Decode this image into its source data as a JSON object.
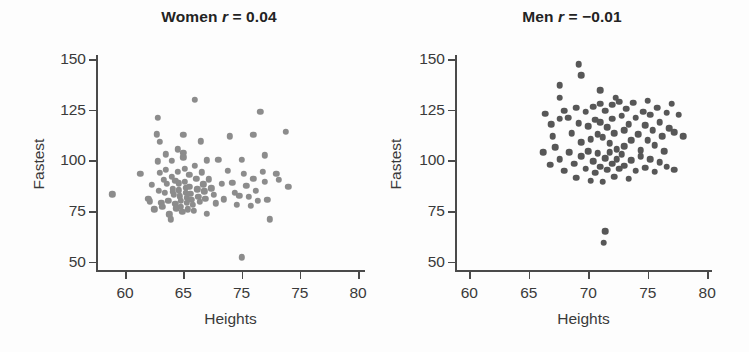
{
  "figure": {
    "background_color": "#fdfdfd",
    "axis_color": "#4a4a4a",
    "text_color": "#3a3a3a"
  },
  "chart_data": [
    {
      "type": "scatter",
      "panel_id": "women",
      "title": "Women r = 0.04",
      "title_prefix": "Women",
      "title_var": "r",
      "title_eq": " = 0.04",
      "correlation_r": 0.04,
      "xlabel": "Heights",
      "ylabel": "Fastest",
      "xlim": [
        57.5,
        80.6
      ],
      "ylim": [
        45,
        152
      ],
      "xticks": [
        60,
        65,
        70,
        75,
        80
      ],
      "xticklabels": [
        "60",
        "65",
        "75",
        "75",
        "80"
      ],
      "yticks": [
        50,
        75,
        100,
        125,
        150
      ],
      "yticklabels": [
        "50",
        "75",
        "100",
        "125",
        "150"
      ],
      "grid": false,
      "legend": "none",
      "marker_color": "#8c8c8c",
      "marker_size": 6.4,
      "n_points": 99,
      "points": [
        [
          58.9,
          83.4
        ],
        [
          61.3,
          93.3
        ],
        [
          62.0,
          81.0
        ],
        [
          62.1,
          79.8
        ],
        [
          62.3,
          88.0
        ],
        [
          62.5,
          75.9
        ],
        [
          62.7,
          112.8
        ],
        [
          62.8,
          121.0
        ],
        [
          62.8,
          99.6
        ],
        [
          62.9,
          85.0
        ],
        [
          63.0,
          109.3
        ],
        [
          63.0,
          94.0
        ],
        [
          63.1,
          79.2
        ],
        [
          63.2,
          77.0
        ],
        [
          63.3,
          90.5
        ],
        [
          63.4,
          84.2
        ],
        [
          63.5,
          103.0
        ],
        [
          63.5,
          95.5
        ],
        [
          63.6,
          88.4
        ],
        [
          63.7,
          80.1
        ],
        [
          63.8,
          73.5
        ],
        [
          63.9,
          71.0
        ],
        [
          64.0,
          99.8
        ],
        [
          64.0,
          92.0
        ],
        [
          64.1,
          86.0
        ],
        [
          64.1,
          84.5
        ],
        [
          64.2,
          83.0
        ],
        [
          64.3,
          90.0
        ],
        [
          64.3,
          78.6
        ],
        [
          64.4,
          76.4
        ],
        [
          64.5,
          105.5
        ],
        [
          64.5,
          94.5
        ],
        [
          64.6,
          88.8
        ],
        [
          64.6,
          85.2
        ],
        [
          64.7,
          82.4
        ],
        [
          64.8,
          80.0
        ],
        [
          64.8,
          77.2
        ],
        [
          64.9,
          74.8
        ],
        [
          65.0,
          112.5
        ],
        [
          65.0,
          103.8
        ],
        [
          65.0,
          101.5
        ],
        [
          65.1,
          96.0
        ],
        [
          65.1,
          89.5
        ],
        [
          65.2,
          86.5
        ],
        [
          65.2,
          84.0
        ],
        [
          65.3,
          81.5
        ],
        [
          65.3,
          79.0
        ],
        [
          65.4,
          76.0
        ],
        [
          65.5,
          93.0
        ],
        [
          65.5,
          87.0
        ],
        [
          65.6,
          83.5
        ],
        [
          65.7,
          80.5
        ],
        [
          65.8,
          78.0
        ],
        [
          65.9,
          75.2
        ],
        [
          66.0,
          130.0
        ],
        [
          66.0,
          97.5
        ],
        [
          66.1,
          91.0
        ],
        [
          66.2,
          85.8
        ],
        [
          66.3,
          82.0
        ],
        [
          66.4,
          79.5
        ],
        [
          66.5,
          109.5
        ],
        [
          66.6,
          94.2
        ],
        [
          66.7,
          88.2
        ],
        [
          66.8,
          84.8
        ],
        [
          66.9,
          81.2
        ],
        [
          67.0,
          100.0
        ],
        [
          67.0,
          73.8
        ],
        [
          67.2,
          90.8
        ],
        [
          67.4,
          86.2
        ],
        [
          67.6,
          83.2
        ],
        [
          67.8,
          78.8
        ],
        [
          68.0,
          100.2
        ],
        [
          68.3,
          88.5
        ],
        [
          68.5,
          80.8
        ],
        [
          68.8,
          95.0
        ],
        [
          69.0,
          112.0
        ],
        [
          69.2,
          89.0
        ],
        [
          69.4,
          84.0
        ],
        [
          69.6,
          78.2
        ],
        [
          69.8,
          82.6
        ],
        [
          70.0,
          52.2
        ],
        [
          70.0,
          100.2
        ],
        [
          70.2,
          93.5
        ],
        [
          70.4,
          87.5
        ],
        [
          70.6,
          82.0
        ],
        [
          70.8,
          77.5
        ],
        [
          71.0,
          112.5
        ],
        [
          71.0,
          91.0
        ],
        [
          71.2,
          85.0
        ],
        [
          71.4,
          80.0
        ],
        [
          71.6,
          124.0
        ],
        [
          71.8,
          94.5
        ],
        [
          72.0,
          102.5
        ],
        [
          72.0,
          89.5
        ],
        [
          72.2,
          80.5
        ],
        [
          72.4,
          71.0
        ],
        [
          73.0,
          93.5
        ],
        [
          73.2,
          90.5
        ],
        [
          73.8,
          114.0
        ],
        [
          74.0,
          87.0
        ]
      ]
    },
    {
      "type": "scatter",
      "panel_id": "men",
      "title": "Men r = −0.01",
      "title_prefix": "Men",
      "title_var": "r",
      "title_eq": " = −0.01",
      "correlation_r": -0.01,
      "xlabel": "Heights",
      "ylabel": "Fastest",
      "xlim": [
        58.8,
        80.4
      ],
      "ylim": [
        45,
        152
      ],
      "xticks": [
        60,
        65,
        70,
        75,
        80
      ],
      "xticklabels": [
        "60",
        "65",
        "70",
        "75",
        "80"
      ],
      "yticks": [
        50,
        75,
        100,
        125,
        150
      ],
      "yticklabels": [
        "50",
        "75",
        "100",
        "125",
        "150"
      ],
      "grid": false,
      "legend": "none",
      "marker_color": "#575757",
      "marker_size": 6.6,
      "n_points": 98,
      "points": [
        [
          67.6,
          137.0
        ],
        [
          67.6,
          131.0
        ],
        [
          69.2,
          147.5
        ],
        [
          69.4,
          142.0
        ],
        [
          71.0,
          134.5
        ],
        [
          72.3,
          131.0
        ],
        [
          66.4,
          123.0
        ],
        [
          66.9,
          118.0
        ],
        [
          67.0,
          112.0
        ],
        [
          67.6,
          120.5
        ],
        [
          68.0,
          124.5
        ],
        [
          68.3,
          121.0
        ],
        [
          68.6,
          113.5
        ],
        [
          69.0,
          126.0
        ],
        [
          69.2,
          118.5
        ],
        [
          69.4,
          109.0
        ],
        [
          69.8,
          124.0
        ],
        [
          70.0,
          117.0
        ],
        [
          70.2,
          110.5
        ],
        [
          70.4,
          126.5
        ],
        [
          70.6,
          120.0
        ],
        [
          70.8,
          113.0
        ],
        [
          71.0,
          128.0
        ],
        [
          71.0,
          119.0
        ],
        [
          71.2,
          111.5
        ],
        [
          71.4,
          124.5
        ],
        [
          71.6,
          116.5
        ],
        [
          71.8,
          108.5
        ],
        [
          72.0,
          127.5
        ],
        [
          72.0,
          120.5
        ],
        [
          72.2,
          113.5
        ],
        [
          72.4,
          105.5
        ],
        [
          72.6,
          129.0
        ],
        [
          72.8,
          122.0
        ],
        [
          73.0,
          115.0
        ],
        [
          73.0,
          107.0
        ],
        [
          73.2,
          125.5
        ],
        [
          73.4,
          118.0
        ],
        [
          73.6,
          110.0
        ],
        [
          73.8,
          128.5
        ],
        [
          74.0,
          121.0
        ],
        [
          74.2,
          113.0
        ],
        [
          74.4,
          105.0
        ],
        [
          74.6,
          124.0
        ],
        [
          74.8,
          117.5
        ],
        [
          75.0,
          129.5
        ],
        [
          75.0,
          110.0
        ],
        [
          75.2,
          122.5
        ],
        [
          75.4,
          115.0
        ],
        [
          75.6,
          107.5
        ],
        [
          75.8,
          126.0
        ],
        [
          76.0,
          119.0
        ],
        [
          76.2,
          112.0
        ],
        [
          76.4,
          104.5
        ],
        [
          76.6,
          123.5
        ],
        [
          76.8,
          116.0
        ],
        [
          77.0,
          128.0
        ],
        [
          77.2,
          114.0
        ],
        [
          77.6,
          122.5
        ],
        [
          66.2,
          104.0
        ],
        [
          66.8,
          98.0
        ],
        [
          67.2,
          106.5
        ],
        [
          67.6,
          100.5
        ],
        [
          68.0,
          95.0
        ],
        [
          68.4,
          104.0
        ],
        [
          68.8,
          98.5
        ],
        [
          69.0,
          91.5
        ],
        [
          69.4,
          102.0
        ],
        [
          69.8,
          96.0
        ],
        [
          70.0,
          104.5
        ],
        [
          70.2,
          90.0
        ],
        [
          70.4,
          99.5
        ],
        [
          70.6,
          94.0
        ],
        [
          70.8,
          103.5
        ],
        [
          71.0,
          97.0
        ],
        [
          71.2,
          89.5
        ],
        [
          71.4,
          101.0
        ],
        [
          71.6,
          95.5
        ],
        [
          71.8,
          104.0
        ],
        [
          72.0,
          98.5
        ],
        [
          72.2,
          92.0
        ],
        [
          72.4,
          100.5
        ],
        [
          72.6,
          96.0
        ],
        [
          72.8,
          103.0
        ],
        [
          73.0,
          97.5
        ],
        [
          73.4,
          91.0
        ],
        [
          73.6,
          100.0
        ],
        [
          74.0,
          95.0
        ],
        [
          74.4,
          102.0
        ],
        [
          74.8,
          96.5
        ],
        [
          75.2,
          100.5
        ],
        [
          75.6,
          94.5
        ],
        [
          76.0,
          99.0
        ],
        [
          76.6,
          97.0
        ],
        [
          77.2,
          95.5
        ],
        [
          71.4,
          65.0
        ],
        [
          71.3,
          59.5
        ],
        [
          78.0,
          112.0
        ]
      ]
    }
  ]
}
